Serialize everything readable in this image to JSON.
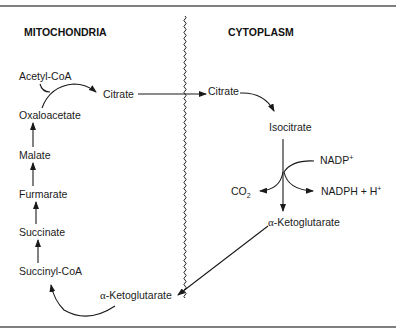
{
  "figure": {
    "type": "metabolic-pathway-diagram",
    "compartments": {
      "left": "MITOCHONDRIA",
      "right": "CYTOPLASM"
    },
    "mitochondria": {
      "acetyl_coa": "Acetyl-CoA",
      "citrate": "Citrate",
      "oxaloacetate": "Oxaloacetate",
      "malate": "Malate",
      "furmarate": "Furmarate",
      "succinate": "Succinate",
      "succinyl_coa": "Succinyl-CoA",
      "akg_greek": "α",
      "akg_rest": "-Ketoglutarate"
    },
    "cytoplasm": {
      "citrate": "Citrate",
      "isocitrate": "Isocitrate",
      "nadp": "NADP",
      "nadp_sup": "+",
      "co2": "CO",
      "co2_sub": "2",
      "nadph": "NADPH + H",
      "nadph_sup": "+",
      "akg_greek": "α",
      "akg_rest": "-Ketoglutarate"
    },
    "membrane": "wavy-membrane-line",
    "colors": {
      "ink": "#1a1a1a",
      "rule": "#555555",
      "background": "#ffffff"
    }
  }
}
